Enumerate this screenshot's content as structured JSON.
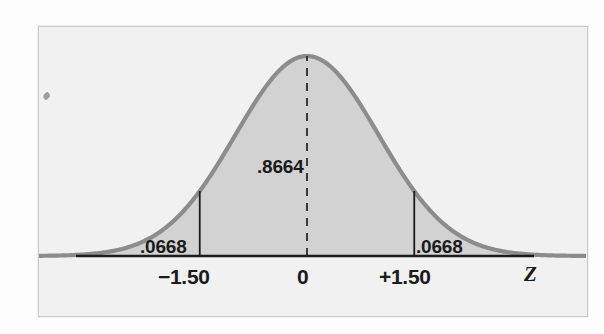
{
  "figure": {
    "kind": "normal-distribution-curve",
    "axis_title": "Z",
    "colors": {
      "page_background": "#fdfdfd",
      "frame_background": "#f1f1f1",
      "frame_border": "#c9c9cf",
      "curve_stroke": "#8c8c8c",
      "curve_fill": "#d2d2d2",
      "axis_line": "#1b1b1b",
      "text": "#1b1b1b",
      "dashed_line": "#333333"
    },
    "labels": {
      "center_area": ".8664",
      "left_tail_area": ".0668",
      "right_tail_area": ".0668"
    },
    "ticks": {
      "left": "−1.50",
      "center": "0",
      "right": "+1.50"
    }
  },
  "chart_data": {
    "type": "area",
    "title": "",
    "subtitle": "",
    "xlabel": "Z",
    "ylabel": "",
    "distribution": "standard normal",
    "mean": 0,
    "std_dev": 1,
    "xlim": [
      -4.0,
      4.0
    ],
    "ylim": [
      0,
      0.42
    ],
    "grid": false,
    "legend": null,
    "x_ticks": [
      -1.5,
      0,
      1.5
    ],
    "x_tick_labels": [
      "−1.50",
      "0",
      "+1.50"
    ],
    "regions": [
      {
        "name": "left-tail",
        "from": -4.0,
        "to": -1.5,
        "area": 0.0668,
        "label": ".0668",
        "shaded": true
      },
      {
        "name": "central",
        "from": -1.5,
        "to": 1.5,
        "area": 0.8664,
        "label": ".8664",
        "shaded": true
      },
      {
        "name": "right-tail",
        "from": 1.5,
        "to": 4.0,
        "area": 0.0668,
        "label": ".0668",
        "shaded": true
      }
    ],
    "annotations": [
      {
        "text": ".8664",
        "x": 0,
        "y": 0.24,
        "kind": "area-label"
      },
      {
        "text": ".0668",
        "x": -1.95,
        "y": 0.03,
        "kind": "area-label"
      },
      {
        "text": ".0668",
        "x": 1.62,
        "y": 0.03,
        "kind": "area-label"
      },
      {
        "text": "Z",
        "x": 3.4,
        "y": -0.04,
        "kind": "axis-title"
      }
    ],
    "vertical_rules": [
      {
        "x": -1.5,
        "style": "solid",
        "from_y": 0,
        "to_y": 0.1295
      },
      {
        "x": 0,
        "style": "dashed",
        "from_y": 0,
        "to_y": 0.3989
      },
      {
        "x": 1.5,
        "style": "solid",
        "from_y": 0,
        "to_y": 0.1295
      }
    ]
  }
}
